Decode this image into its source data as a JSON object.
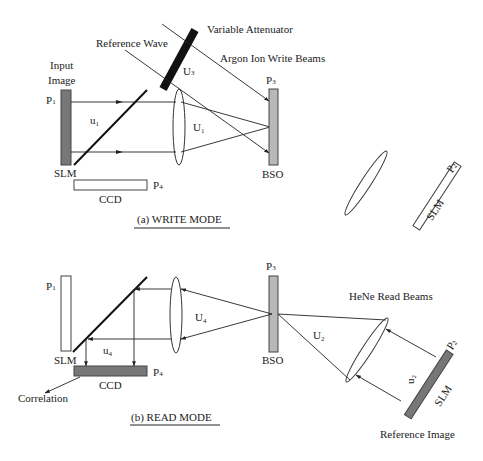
{
  "figure": {
    "write_mode": {
      "caption": "(a)  WRITE MODE",
      "labels": {
        "variable_attenuator": "Variable Attenuator",
        "reference_wave": "Reference Wave",
        "argon_beams": "Argon Ion Write Beams",
        "input_image_line1": "Input",
        "input_image_line2": "Image",
        "p1": "P",
        "p1_sub": "1",
        "u1_small": "u",
        "u1_small_sub": "1",
        "u1_lens": "U",
        "u1_lens_sub": "1",
        "u3": "U",
        "u3_sub": "3",
        "p3": "P",
        "p3_sub": "3",
        "bso": "BSO",
        "slm": "SLM",
        "ccd": "CCD",
        "p4": "P",
        "p4_sub": "4",
        "p2": "P",
        "p2_sub": "2",
        "slm2": "SLM"
      }
    },
    "read_mode": {
      "caption": "(b)   READ MODE",
      "labels": {
        "p1": "P",
        "p1_sub": "1",
        "slm": "SLM",
        "u4_small": "u",
        "u4_small_sub": "4",
        "u4_lens": "U",
        "u4_lens_sub": "4",
        "ccd": "CCD",
        "p4": "P",
        "p4_sub": "4",
        "correlation": "Correlation",
        "p3": "P",
        "p3_sub": "3",
        "bso": "BSO",
        "u2_lens": "U",
        "u2_lens_sub": "2",
        "hene_beams": "HeNe Read Beams",
        "u2_small": "u",
        "u2_small_sub": "2",
        "p2": "P",
        "p2_sub": "2",
        "slm2": "SLM",
        "reference_image": "Reference Image"
      }
    },
    "colors": {
      "line": "#222222",
      "slm_fill": "#777777",
      "bso_fill": "#b8b8b8",
      "attenuator_fill": "#111111",
      "ccd_read_fill": "#777777"
    }
  }
}
